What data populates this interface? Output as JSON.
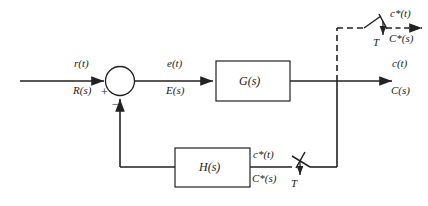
{
  "diagram": {
    "stroke_color": "#222222",
    "background": "#ffffff",
    "blocks": [
      {
        "name": "forward-transfer-block",
        "label": "G(s)"
      },
      {
        "name": "feedback-transfer-block",
        "label": "H(s)"
      }
    ],
    "signals": {
      "input_time": "r(t)",
      "input_laplace": "R(s)",
      "error_time": "e(t)",
      "error_laplace": "E(s)",
      "output_time": "c(t)",
      "output_laplace": "C(s)",
      "sampled_output_time": "c*(t)",
      "sampled_output_laplace": "C*(s)",
      "feedback_sampled_time": "c*(t)",
      "feedback_sampled_laplace": "C*(s)"
    },
    "summing_junction": {
      "name": "summing-junction",
      "plus_sign": "+",
      "minus_sign": "−"
    },
    "samplers": [
      {
        "name": "output-sampler",
        "period_label": "T"
      },
      {
        "name": "feedback-sampler",
        "period_label": "T"
      }
    ]
  }
}
